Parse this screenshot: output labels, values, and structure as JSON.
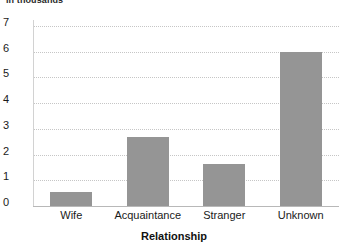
{
  "chart_data": {
    "type": "bar",
    "title": "in thousands",
    "xlabel": "Relationship",
    "ylabel": "",
    "categories": [
      "Wife",
      "Acquaintance",
      "Stranger",
      "Unknown"
    ],
    "values": [
      0.55,
      2.7,
      1.65,
      6.0
    ],
    "ylim": [
      0,
      7
    ],
    "yticks": [
      0,
      1,
      2,
      3,
      4,
      5,
      6,
      7
    ],
    "ytick_labels": [
      "0",
      "1",
      "2",
      "3",
      "4",
      "5",
      "6",
      "7"
    ],
    "grid": true,
    "grid_style": "dotted",
    "legend": "none",
    "bar_color": "#959595",
    "gridline_color": "#c6c6c6",
    "axis_color": "#b8b8b8",
    "text_color": "#1a1a1a",
    "background": "#ffffff",
    "note": "chart title row is clipped at the top edge of the screenshot"
  },
  "labels": {
    "y_0": "0",
    "y_1": "1",
    "y_2": "2",
    "y_3": "3",
    "y_4": "4",
    "y_5": "5",
    "y_6": "6",
    "y_7": "7",
    "cat_0": "Wife",
    "cat_1": "Acquaintance",
    "cat_2": "Stranger",
    "cat_3": "Unknown",
    "header_note": "in thousands",
    "axis_title_x": "Relationship"
  }
}
